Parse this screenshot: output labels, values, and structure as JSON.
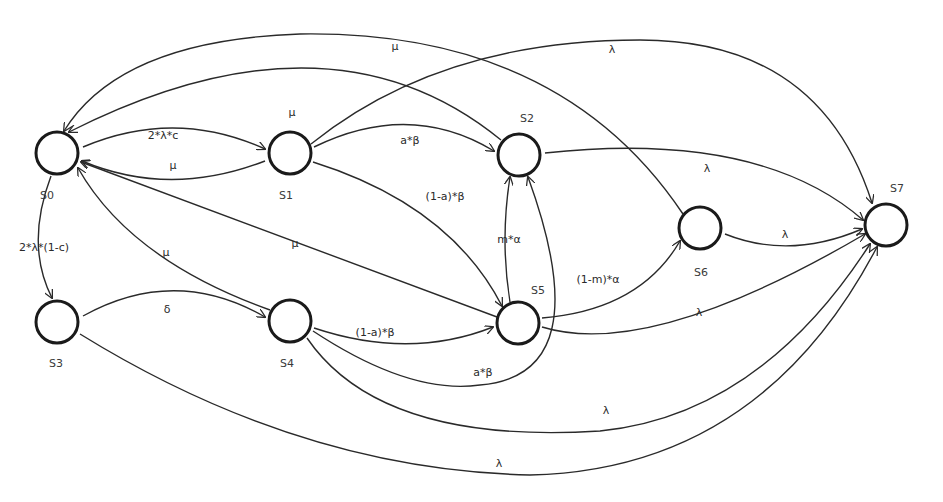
{
  "diagram": {
    "type": "state-transition",
    "colors": {
      "stroke": "#1a1a1a",
      "edge": "#2a2a2a",
      "text": "#2a2a2a",
      "background": "#ffffff"
    },
    "nodes": [
      {
        "id": "S0",
        "label": "S0",
        "cx": 57,
        "cy": 153,
        "r": 21,
        "lx": 40,
        "ly": 199
      },
      {
        "id": "S1",
        "label": "S1",
        "cx": 290,
        "cy": 153,
        "r": 21,
        "lx": 279,
        "ly": 199
      },
      {
        "id": "S2",
        "label": "S2",
        "cx": 519,
        "cy": 155,
        "r": 21,
        "lx": 520,
        "ly": 122
      },
      {
        "id": "S3",
        "label": "S3",
        "cx": 57,
        "cy": 322,
        "r": 21,
        "lx": 49,
        "ly": 367
      },
      {
        "id": "S4",
        "label": "S4",
        "cx": 290,
        "cy": 321,
        "r": 21,
        "lx": 280,
        "ly": 367
      },
      {
        "id": "S5",
        "label": "S5",
        "cx": 518,
        "cy": 323,
        "r": 21,
        "lx": 531,
        "ly": 294
      },
      {
        "id": "S6",
        "label": "S6",
        "cx": 700,
        "cy": 228,
        "r": 21,
        "lx": 694,
        "ly": 276
      },
      {
        "id": "S7",
        "label": "S7",
        "cx": 886,
        "cy": 225,
        "r": 21,
        "lx": 890,
        "ly": 192
      }
    ],
    "edges": [
      {
        "from": "S0",
        "to": "S1",
        "label": "2*λ*c",
        "path": "M 83 147 Q 175 108 265 149",
        "lx": 163,
        "ly": 139
      },
      {
        "from": "S1",
        "to": "S0",
        "label": "μ",
        "path": "M 265 161 Q 170 198 82 161",
        "lx": 173,
        "ly": 169
      },
      {
        "from": "S0",
        "to": "S3",
        "label": "2*λ*(1-c)",
        "path": "M 51 176 Q 25 245 52 298",
        "lx": 44,
        "ly": 251
      },
      {
        "from": "S3",
        "to": "S4",
        "label": "δ",
        "path": "M 83 316 Q 175 265 265 317",
        "lx": 167,
        "ly": 313
      },
      {
        "from": "S4",
        "to": "S0",
        "label": "μ",
        "path": "M 270 310 Q 130 260 78 168",
        "lx": 166,
        "ly": 256
      },
      {
        "from": "S5",
        "to": "S0",
        "label": "μ",
        "path": "M 497 317 Q 290 240 81 162",
        "lx": 295,
        "ly": 247
      },
      {
        "from": "S2",
        "to": "S0",
        "label": "μ",
        "path": "M 501 140 Q 330 0 69 132",
        "lx": 292,
        "ly": 116
      },
      {
        "from": "S6",
        "to": "S0",
        "label": "μ",
        "path": "M 683 214 Q 560 30 300 34 Q 120 40 64 131",
        "lx": 395,
        "ly": 50
      },
      {
        "from": "S1",
        "to": "S2",
        "label": "a*β",
        "path": "M 314 147 Q 410 100 494 151",
        "lx": 410,
        "ly": 144
      },
      {
        "from": "S1",
        "to": "S5",
        "label": "(1-a)*β",
        "path": "M 313 162 Q 450 205 502 306",
        "lx": 445,
        "ly": 200
      },
      {
        "from": "S1",
        "to": "S7",
        "label": "λ",
        "path": "M 311 144 Q 440 40 640 40 Q 820 40 872 203",
        "lx": 612,
        "ly": 53
      },
      {
        "from": "S4",
        "to": "S5",
        "label": "(1-a)*β",
        "path": "M 314 328 Q 410 360 493 327",
        "lx": 375,
        "ly": 336
      },
      {
        "from": "S4",
        "to": "S2",
        "label": "a*β",
        "path": "M 313 331 Q 410 395 480 385 Q 600 375 528 177",
        "lx": 483,
        "ly": 376
      },
      {
        "from": "S4",
        "to": "S7",
        "label": "λ",
        "path": "M 307 338 Q 380 445 600 431 Q 760 415 870 244",
        "lx": 606,
        "ly": 414
      },
      {
        "from": "S3",
        "to": "S7",
        "label": "λ",
        "path": "M 80 334 Q 300 470 530 475 Q 760 470 877 247",
        "lx": 499,
        "ly": 467
      },
      {
        "from": "S5",
        "to": "S2",
        "label": "m*α",
        "path": "M 510 302 Q 500 240 510 177",
        "lx": 509,
        "ly": 243
      },
      {
        "from": "S5",
        "to": "S6",
        "label": "(1-m)*α",
        "path": "M 542 318 Q 640 310 680 241",
        "lx": 598,
        "ly": 283
      },
      {
        "from": "S5",
        "to": "S7",
        "label": "λ",
        "path": "M 542 327 Q 650 360 865 234",
        "lx": 699,
        "ly": 316
      },
      {
        "from": "S2",
        "to": "S7",
        "label": "λ",
        "path": "M 545 153 Q 760 130 863 220",
        "lx": 707,
        "ly": 172
      },
      {
        "from": "S6",
        "to": "S7",
        "label": "λ",
        "path": "M 725 234 Q 790 260 862 229",
        "lx": 785,
        "ly": 238
      }
    ]
  }
}
